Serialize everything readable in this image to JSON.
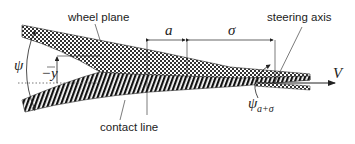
{
  "diagram": {
    "type": "tire-contact-kinematics",
    "labels": {
      "wheel_plane": "wheel plane",
      "steering_axis": "steering axis",
      "contact_line": "contact line"
    },
    "symbols": {
      "psi": "ψ",
      "minus_y_bar": "−y",
      "a": "a",
      "sigma": "σ",
      "V": "V",
      "psi_sub_main": "ψ",
      "psi_sub_index": "a+σ"
    },
    "colors": {
      "ink": "#222222",
      "background": "#ffffff"
    },
    "regions": [
      {
        "name": "wheel-plane-band",
        "pattern": "cross-hatch"
      },
      {
        "name": "contact-line-band",
        "pattern": "diagonal-stripes"
      }
    ]
  }
}
